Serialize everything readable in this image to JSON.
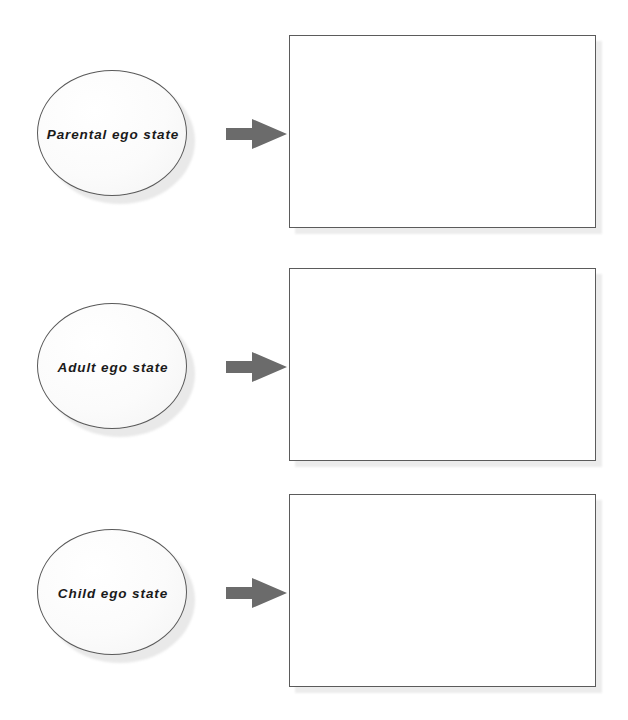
{
  "diagram": {
    "background_color": "#ffffff",
    "node_stroke_color": "#5a5a5a",
    "node_fill_color": "#fafafa",
    "arrow_color": "#6b6b6b",
    "box_stroke_color": "#5b5b5b",
    "box_fill_color": "#ffffff",
    "shadow_color": "#ececec",
    "rows": [
      {
        "label": "Parental ego state",
        "answer_text": "",
        "arrow": "right-block-arrow"
      },
      {
        "label": "Adult ego state",
        "answer_text": "",
        "arrow": "right-block-arrow"
      },
      {
        "label": "Child ego state",
        "answer_text": "",
        "arrow": "right-block-arrow"
      }
    ]
  }
}
